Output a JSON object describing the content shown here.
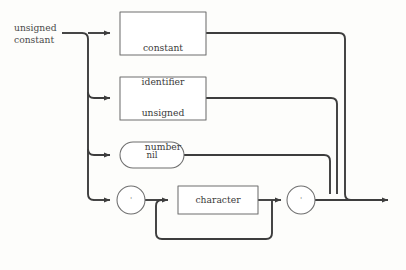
{
  "diagram": {
    "kind": "railroad-syntax-diagram",
    "title": "unsigned constant",
    "background_color": "#fdfdfb",
    "line_color": "#3d3d3d",
    "box_border_color": "#6e6e6e",
    "text_color": "#3a3a3a",
    "entry": {
      "label_line1": "unsigned",
      "label_line2": "constant"
    },
    "branches": [
      {
        "index": 0,
        "shape": "rectangle",
        "label_line1": "constant",
        "label_line2": "identifier",
        "row_y": 33
      },
      {
        "index": 1,
        "shape": "rectangle",
        "label_line1": "unsigned",
        "label_line2": "number",
        "row_y": 98
      },
      {
        "index": 2,
        "shape": "stadium",
        "label_line1": "nil",
        "label_line2": "",
        "row_y": 155
      },
      {
        "index": 3,
        "shape": "composite-quoted-string",
        "label_line1": "character",
        "label_line2": "",
        "row_y": 200
      }
    ],
    "terminals": {
      "open_quote": "'",
      "close_quote": "'",
      "character_box": "character",
      "nil_keyword": "nil"
    },
    "loop": {
      "name": "character-repeat-loop",
      "description": "character"
    },
    "exit": {
      "arrow": "▶"
    }
  }
}
